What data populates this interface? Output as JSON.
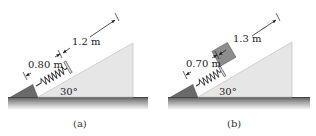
{
  "panels": [
    {
      "caption": "(a)",
      "angle_label": "30°",
      "spring_length_label": "0.80 m",
      "distance_label": "1.2 m",
      "has_block": false
    },
    {
      "caption": "(b)",
      "angle_label": "30°",
      "spring_length_label": "0.70 m",
      "distance_label": "1.3 m",
      "has_block": true
    }
  ],
  "colors": {
    "incline": "#e6e6e6",
    "incline_edge": "#c8c8c8",
    "ground": "#6e6e6e",
    "wedge": "#6a6a6a",
    "block": "#8c8c8c",
    "spring": "#333333",
    "dimension": "#222222"
  }
}
